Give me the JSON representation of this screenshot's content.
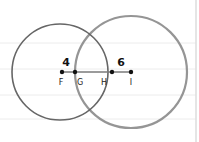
{
  "diagram": {
    "paper_lines_y": [
      43,
      69,
      95,
      119
    ],
    "margin_line_x": 196,
    "colors": {
      "paper_line": "#ececec",
      "margin_line": "#dcdcdc",
      "circle_left": "#666666",
      "circle_right": "#8a8a8a",
      "segment": "#7a7a7a",
      "point": "#111111"
    },
    "circles": [
      {
        "name": "left-circle",
        "cx": 60,
        "cy": 72,
        "r": 48
      },
      {
        "name": "right-circle",
        "cx": 131,
        "cy": 72,
        "r": 56
      }
    ],
    "points": [
      {
        "label": "F",
        "x": 62,
        "y": 72,
        "label_x": 61,
        "label_y": 85
      },
      {
        "label": "G",
        "x": 75,
        "y": 72,
        "label_x": 80,
        "label_y": 85
      },
      {
        "label": "H",
        "x": 112,
        "y": 72,
        "label_x": 104,
        "label_y": 85
      },
      {
        "label": "I",
        "x": 131,
        "y": 72,
        "label_x": 131,
        "label_y": 85
      }
    ],
    "measurements": [
      {
        "text": "4",
        "x": 66,
        "y": 65
      },
      {
        "text": "6",
        "x": 121,
        "y": 65
      }
    ]
  }
}
